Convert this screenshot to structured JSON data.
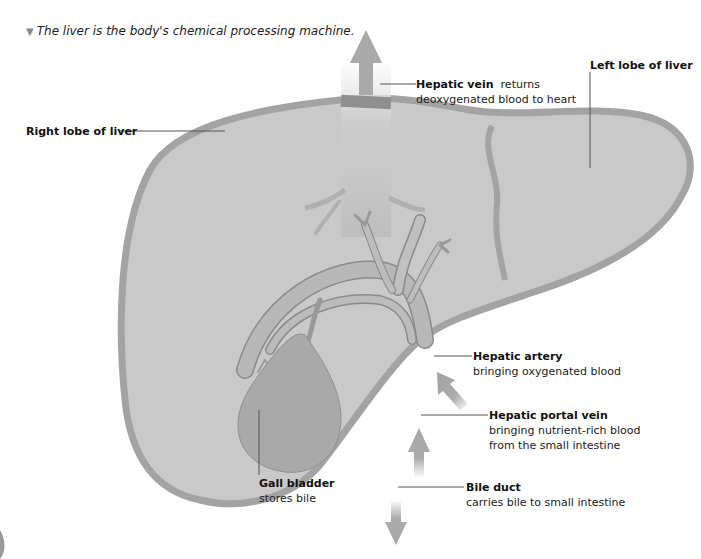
{
  "caption": {
    "marker_icon": "triangle-down-icon",
    "text": "The liver is the body's chemical processing machine."
  },
  "colors": {
    "liver_fill": "#c9c9c9",
    "liver_outline": "#a6a6a6",
    "vessel": "#b4b4b4",
    "vessel_dark": "#8c8c8c",
    "gall_bladder": "#a9a9a9",
    "arrow": "#ababab",
    "text": "#1a1a1a"
  },
  "labels": {
    "hepatic_vein": {
      "title": "Hepatic vein",
      "desc_inline": "returns",
      "desc": "deoxygenated blood to heart"
    },
    "left_lobe": {
      "title": "Left lobe of liver"
    },
    "right_lobe": {
      "title": "Right lobe of liver"
    },
    "hepatic_artery": {
      "title": "Hepatic artery",
      "desc": "bringing oxygenated blood"
    },
    "hepatic_portal_vein": {
      "title": "Hepatic portal vein",
      "desc1": "bringing nutrient-rich blood",
      "desc2": "from the small intestine"
    },
    "gall_bladder": {
      "title": "Gall bladder",
      "desc": "stores bile"
    },
    "bile_duct": {
      "title": "Bile duct",
      "desc": "carries bile to small intestine"
    }
  }
}
